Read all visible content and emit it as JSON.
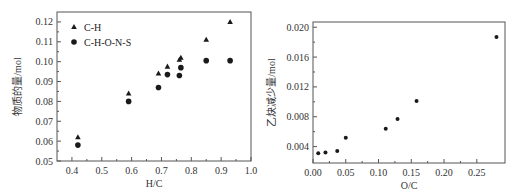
{
  "chart_data": [
    {
      "type": "scatter",
      "title": "",
      "xlabel": "H/C",
      "ylabel": "物质的量/mol",
      "xlim": [
        0.35,
        1.0
      ],
      "ylim": [
        0.05,
        0.125
      ],
      "xticks": [
        0.4,
        0.5,
        0.6,
        0.7,
        0.8,
        0.9,
        1.0
      ],
      "xtick_labels": [
        "0.4",
        "0.5",
        "0.6",
        "0.7",
        "0.8",
        "0.9",
        "1.0"
      ],
      "yticks": [
        0.05,
        0.06,
        0.07,
        0.08,
        0.09,
        0.1,
        0.11,
        0.12
      ],
      "ytick_labels": [
        "0.05",
        "0.06",
        "0.07",
        "0.08",
        "0.09",
        "0.10",
        "0.11",
        "0.12"
      ],
      "grid": false,
      "legend_position": "upper left",
      "series": [
        {
          "name": "C-H",
          "marker": "triangle",
          "x": [
            0.42,
            0.59,
            0.69,
            0.72,
            0.76,
            0.765,
            0.85,
            0.93
          ],
          "y": [
            0.062,
            0.084,
            0.094,
            0.0975,
            0.101,
            0.102,
            0.111,
            0.12
          ]
        },
        {
          "name": "C-H-O-N-S",
          "marker": "circle",
          "x": [
            0.42,
            0.59,
            0.69,
            0.72,
            0.76,
            0.765,
            0.85,
            0.93
          ],
          "y": [
            0.058,
            0.08,
            0.087,
            0.0935,
            0.093,
            0.097,
            0.1005,
            0.1005
          ]
        }
      ]
    },
    {
      "type": "scatter",
      "title": "",
      "xlabel": "O/C",
      "ylabel": "乙炔减少量/mol",
      "xlim": [
        0.0,
        0.293
      ],
      "ylim": [
        0.0018,
        0.0207
      ],
      "xticks": [
        0.0,
        0.05,
        0.1,
        0.15,
        0.2,
        0.25
      ],
      "xtick_labels": [
        "0.00",
        "0.05",
        "0.10",
        "0.15",
        "0.20",
        "0.25"
      ],
      "yticks": [
        0.004,
        0.008,
        0.012,
        0.016,
        0.02
      ],
      "ytick_labels": [
        "0.004",
        "0.008",
        "0.012",
        "0.016",
        "0.020"
      ],
      "grid": false,
      "series": [
        {
          "name": "",
          "marker": "circle",
          "x": [
            0.008,
            0.019,
            0.037,
            0.05,
            0.111,
            0.129,
            0.158,
            0.28
          ],
          "y": [
            0.0031,
            0.0032,
            0.0034,
            0.0052,
            0.0064,
            0.0077,
            0.0101,
            0.0187
          ]
        }
      ]
    }
  ],
  "layout": {
    "plots": [
      {
        "left": 57,
        "top": 12,
        "right": 251,
        "bottom": 161
      },
      {
        "left": 313,
        "top": 22,
        "right": 505,
        "bottom": 163
      }
    ],
    "colors": {
      "axis": "#555555",
      "marker": "#1a1a1a"
    }
  }
}
